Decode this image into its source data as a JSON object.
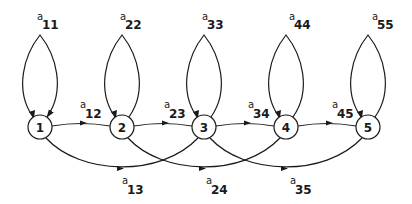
{
  "diagram": {
    "type": "state-transition-graph",
    "nodes": [
      {
        "id": "1",
        "label": "1"
      },
      {
        "id": "2",
        "label": "2"
      },
      {
        "id": "3",
        "label": "3"
      },
      {
        "id": "4",
        "label": "4"
      },
      {
        "id": "5",
        "label": "5"
      }
    ],
    "self_loops": [
      {
        "node": "1",
        "symbol": "a",
        "subscript": "11"
      },
      {
        "node": "2",
        "symbol": "a",
        "subscript": "22"
      },
      {
        "node": "3",
        "symbol": "a",
        "subscript": "33"
      },
      {
        "node": "4",
        "symbol": "a",
        "subscript": "44"
      },
      {
        "node": "5",
        "symbol": "a",
        "subscript": "55"
      }
    ],
    "forward_edges": [
      {
        "from": "1",
        "to": "2",
        "symbol": "a",
        "subscript": "12"
      },
      {
        "from": "2",
        "to": "3",
        "symbol": "a",
        "subscript": "23"
      },
      {
        "from": "3",
        "to": "4",
        "symbol": "a",
        "subscript": "34"
      },
      {
        "from": "4",
        "to": "5",
        "symbol": "a",
        "subscript": "45"
      }
    ],
    "skip_edges": [
      {
        "from": "1",
        "to": "3",
        "symbol": "a",
        "subscript": "13"
      },
      {
        "from": "2",
        "to": "4",
        "symbol": "a",
        "subscript": "24"
      },
      {
        "from": "3",
        "to": "5",
        "symbol": "a",
        "subscript": "35"
      }
    ],
    "colors": {
      "stroke": "#1a1a1a",
      "background": "#ffffff"
    }
  }
}
